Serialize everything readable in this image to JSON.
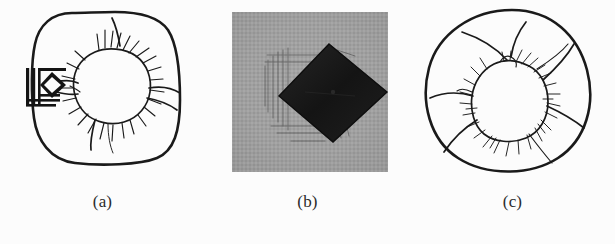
{
  "figure": {
    "background_color": "#fcfcfc",
    "ink_color": "#1a1a1a",
    "panel_count": 3,
    "layout": "three panels side by side, each with a lettered caption centered beneath"
  },
  "panels": [
    {
      "id": "a",
      "caption": "(a)",
      "type": "line-drawing",
      "outline_shape": "rounded-square",
      "content": "irregular starburst crack pattern with radiating hair lines around a central rounded void",
      "marker": {
        "name": "scale-bar-marker",
        "description": "stacked horizontal bars with an inscribed diamond at the left of the crack pattern",
        "color": "#141414"
      }
    },
    {
      "id": "b",
      "caption": "(b)",
      "type": "grayscale-photograph",
      "outline_shape": "square",
      "background_gray": "#9d9d9d",
      "content": "dark rotated square (diamond) centred on a mottled gray textured field with faint streaks at the left",
      "object_color": "#1c1c1c"
    },
    {
      "id": "c",
      "caption": "(c)",
      "type": "line-drawing",
      "outline_shape": "circle",
      "content": "irregular rounded blob with dense radiating hair-like lines and three long sweeping strokes",
      "marker": null
    }
  ],
  "captions": {
    "a": "(a)",
    "b": "(b)",
    "c": "(c)"
  }
}
